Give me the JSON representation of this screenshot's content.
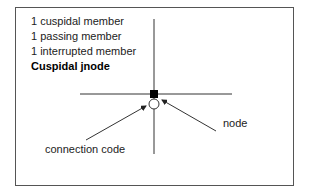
{
  "legend_lines": [
    "1 cuspidal member",
    "1 passing member",
    "1 interrupted member"
  ],
  "title": "Cuspidal jnode",
  "labels": {
    "connection_code": "connection code",
    "node": "node"
  },
  "colors": {
    "line": "#333333",
    "node_fill": "#000000",
    "connection_fill": "#ffffff"
  }
}
